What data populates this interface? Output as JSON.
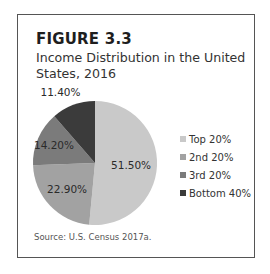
{
  "figure": {
    "label": "FIGURE 3.3",
    "title": "Income Distribution in the United States, 2016",
    "source": "Source: U.S. Census 2017a."
  },
  "chart_data": {
    "type": "pie",
    "title": "Income Distribution in the United States, 2016",
    "categories": [
      "Top 20%",
      "2nd 20%",
      "3rd 20%",
      "Bottom 40%"
    ],
    "values": [
      51.5,
      22.9,
      14.2,
      11.4
    ],
    "data_labels": [
      "51.50%",
      "22.90%",
      "14.20%",
      "11.40%"
    ],
    "colors": [
      "#c9c9c9",
      "#a2a2a2",
      "#7b7b7b",
      "#3b3b3b"
    ],
    "start": "12 o'clock",
    "direction": "clockwise",
    "legend_position": "right",
    "source": "Source: U.S. Census 2017a."
  }
}
